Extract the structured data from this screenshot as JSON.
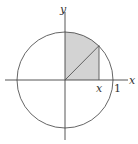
{
  "diagram": {
    "title": "",
    "labels": {
      "y_axis": "y",
      "x_axis": "x",
      "x_marker": "x",
      "one_marker": "1"
    },
    "colors": {
      "stroke": "#555555",
      "shade": "#d3d3d3",
      "background": "#ffffff"
    },
    "geometry": {
      "origin": [
        65,
        80
      ],
      "radius": 48,
      "x_value": 0.7
    },
    "elements": [
      "unit circle centered at origin",
      "x axis",
      "y axis",
      "shaded region under circle from 0 to x in first quadrant",
      "radius segment from origin to point on circle",
      "vertical segment at x"
    ]
  }
}
